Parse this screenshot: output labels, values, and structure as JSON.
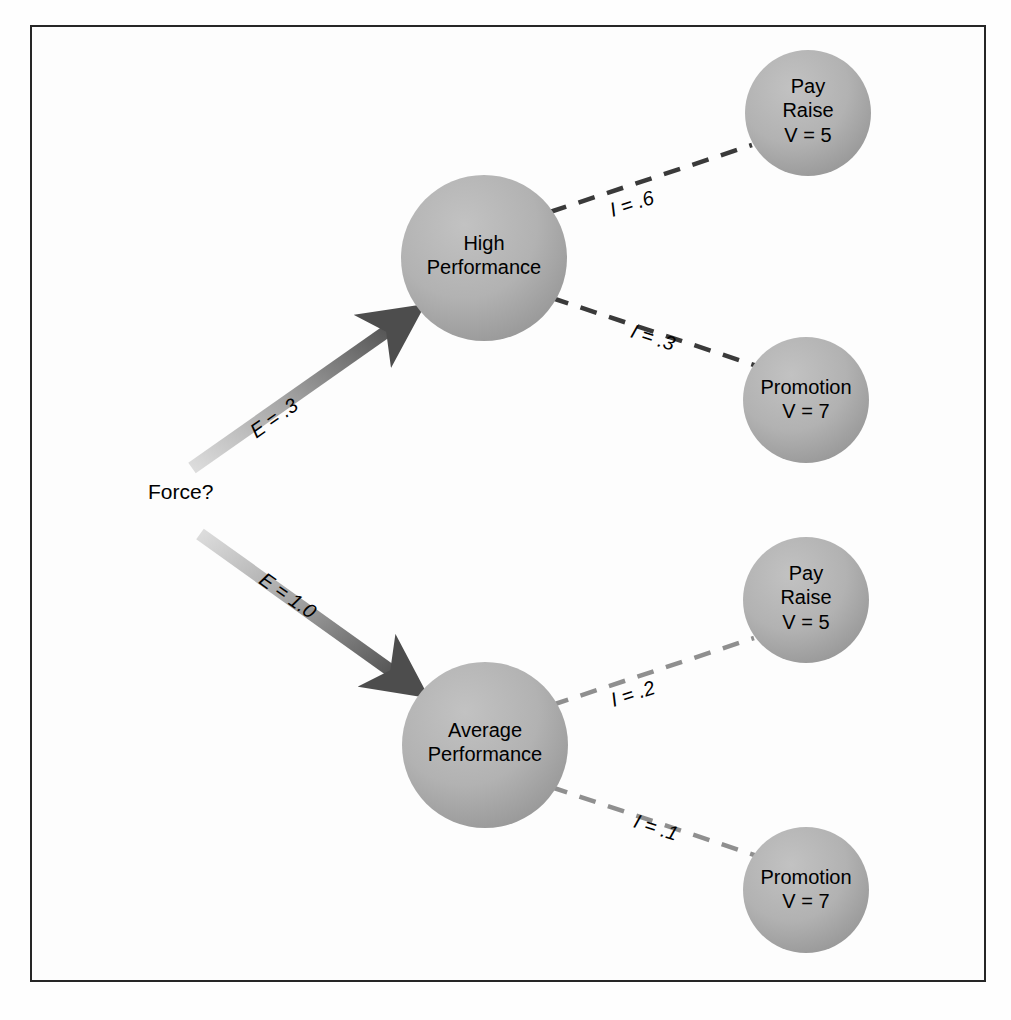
{
  "diagram": {
    "source": {
      "label": "Force?",
      "x": 148,
      "y": 480
    },
    "nodes": [
      {
        "id": "high-performance",
        "label": "High\nPerformance",
        "cx": 484,
        "cy": 258,
        "r": 83,
        "size": "big"
      },
      {
        "id": "average-performance",
        "label": "Average\nPerformance",
        "cx": 485,
        "cy": 745,
        "r": 83,
        "size": "big"
      },
      {
        "id": "pay-raise-high",
        "label": "Pay\nRaise\nV = 5",
        "cx": 808,
        "cy": 113,
        "r": 63,
        "size": "small"
      },
      {
        "id": "promotion-high",
        "label": "Promotion\nV = 7",
        "cx": 806,
        "cy": 400,
        "r": 63,
        "size": "small"
      },
      {
        "id": "pay-raise-avg",
        "label": "Pay\nRaise\nV = 5",
        "cx": 806,
        "cy": 600,
        "r": 63,
        "size": "small"
      },
      {
        "id": "promotion-avg",
        "label": "Promotion\nV = 7",
        "cx": 806,
        "cy": 890,
        "r": 63,
        "size": "small"
      }
    ],
    "arrows": [
      {
        "id": "expectancy-high",
        "label": "E = .3",
        "from": "Force?",
        "to": "High Performance",
        "x1": 192,
        "y1": 468,
        "x2": 414,
        "y2": 312,
        "label_x": 246,
        "label_y": 424,
        "label_rotation": -35
      },
      {
        "id": "expectancy-average",
        "label": "E = 1.0",
        "from": "Force?",
        "to": "Average Performance",
        "x1": 200,
        "y1": 534,
        "x2": 418,
        "y2": 690,
        "label_x": 268,
        "label_y": 568,
        "label_rotation": 35
      }
    ],
    "links": [
      {
        "id": "instrumentality-high-payraise",
        "label": "I = .6",
        "from": "High Performance",
        "to": "Pay Raise",
        "x1": 550,
        "y1": 212,
        "x2": 752,
        "y2": 145,
        "tone": "dark",
        "label_x": 607,
        "label_y": 200,
        "label_rotation": -18
      },
      {
        "id": "instrumentality-high-promotion",
        "label": "I = .3",
        "from": "High Performance",
        "to": "Promotion",
        "x1": 552,
        "y1": 298,
        "x2": 760,
        "y2": 367,
        "tone": "dark",
        "label_x": 635,
        "label_y": 320,
        "label_rotation": 18
      },
      {
        "id": "instrumentality-avg-payraise",
        "label": "I = .2",
        "from": "Average Performance",
        "to": "Pay Raise",
        "x1": 552,
        "y1": 705,
        "x2": 754,
        "y2": 638,
        "tone": "light",
        "label_x": 608,
        "label_y": 690,
        "label_rotation": -18
      },
      {
        "id": "instrumentality-avg-promotion",
        "label": "I = .1",
        "from": "Average Performance",
        "to": "Promotion",
        "x1": 551,
        "y1": 787,
        "x2": 760,
        "y2": 857,
        "tone": "light",
        "label_x": 638,
        "label_y": 810,
        "label_rotation": 18
      }
    ],
    "colors": {
      "node_fill_light": "#b9b9b9",
      "node_fill_dark": "#9a9a9a",
      "arrow_tail": "#d7d7d7",
      "arrow_head": "#4d4d4d",
      "dash_dark": "#3a3a3a",
      "dash_light": "#8f8f8f",
      "frame_border": "#262626",
      "text": "#000000",
      "background": "#fdfdfd"
    }
  }
}
